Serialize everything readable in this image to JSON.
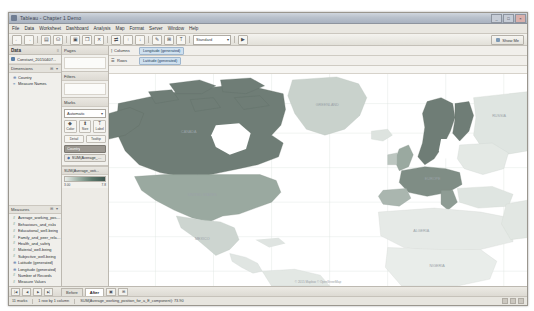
{
  "window": {
    "title": "Tableau - Chapter 1 Demo",
    "app_icon": "tableau-icon",
    "minimize": "_",
    "maximize": "□",
    "close": "×"
  },
  "menu": {
    "items": [
      "File",
      "Data",
      "Worksheet",
      "Dashboard",
      "Analysis",
      "Map",
      "Format",
      "Server",
      "Window",
      "Help"
    ]
  },
  "toolbar": {
    "buttons": [
      {
        "name": "back-button",
        "glyph": "←"
      },
      {
        "name": "forward-button",
        "glyph": "→"
      },
      {
        "name": "save-button",
        "glyph": "▤"
      },
      {
        "name": "new-data-source-button",
        "glyph": "⛁"
      },
      {
        "name": "new-worksheet-button",
        "glyph": "▣"
      },
      {
        "name": "duplicate-sheet-button",
        "glyph": "❐"
      },
      {
        "name": "clear-sheet-button",
        "glyph": "✕"
      },
      {
        "name": "swap-rows-columns-button",
        "glyph": "⇄"
      },
      {
        "name": "sort-ascending-button",
        "glyph": "↑"
      },
      {
        "name": "sort-descending-button",
        "glyph": "↓"
      },
      {
        "name": "highlight-button",
        "glyph": "✎"
      },
      {
        "name": "group-members-button",
        "glyph": "⊞"
      },
      {
        "name": "show-mark-labels-button",
        "glyph": "T"
      },
      {
        "name": "presentation-mode-button",
        "glyph": "▶"
      }
    ],
    "fit_label": "Standard",
    "fit_caret": "▾",
    "showme_label": "Show Me"
  },
  "data_pane": {
    "header": "Data",
    "header_control": "≡",
    "datasource": "Constant_20150407...",
    "datasource_icon": "database-icon",
    "dimensions_label": "Dimensions",
    "dimensions_control": "⊞ ▾",
    "dimensions": [
      {
        "label": "Country",
        "icon": "globe-icon"
      },
      {
        "label": "Measure Names",
        "icon": "abc-icon"
      }
    ],
    "measures_label": "Measures",
    "measures_control": "⊞ ▾",
    "measures": [
      {
        "label": "Average_working_position",
        "icon": "hash-icon"
      },
      {
        "label": "Behaviours_and_risks",
        "icon": "hash-icon"
      },
      {
        "label": "Educational_well-being",
        "icon": "hash-icon"
      },
      {
        "label": "Family_and_peer_relation",
        "icon": "hash-icon"
      },
      {
        "label": "Health_and_safety",
        "icon": "hash-icon"
      },
      {
        "label": "Material_well-being",
        "icon": "hash-icon"
      },
      {
        "label": "Subjective_well-being",
        "icon": "hash-icon"
      },
      {
        "label": "Latitude (generated)",
        "icon": "globe-icon"
      },
      {
        "label": "Longitude (generated)",
        "icon": "globe-icon"
      },
      {
        "label": "Number of Records",
        "icon": "hash-icon"
      },
      {
        "label": "Measure Values",
        "icon": "hash-icon"
      }
    ]
  },
  "cards": {
    "pages_label": "Pages",
    "filters_label": "Filters",
    "marks_label": "Marks",
    "marks_type": "Automatic",
    "marks_type_caret": "▾",
    "mark_buttons": [
      {
        "label": "Color",
        "icon": "color-palette-icon",
        "glyph": "◆"
      },
      {
        "label": "Size",
        "icon": "size-icon",
        "glyph": "⬍"
      },
      {
        "label": "Label",
        "icon": "label-icon",
        "glyph": "T"
      }
    ],
    "mark_buttons_secondary": [
      {
        "label": "Detail",
        "icon": "detail-icon"
      },
      {
        "label": "Tooltip",
        "icon": "tooltip-icon"
      }
    ],
    "mark_pills": [
      {
        "label": "Country",
        "icon": "detail-icon",
        "selected": true
      },
      {
        "label": "SUM(Average_w...)",
        "icon": "color-icon",
        "selected": false
      }
    ],
    "legend_title": "SUM(Average_voti...",
    "legend_min": "3.00",
    "legend_max": "7.8"
  },
  "shelves": {
    "columns_label": "Columns",
    "columns_icon": "columns-icon",
    "columns_pill": "Longitude (generated)",
    "rows_label": "Rows",
    "rows_icon": "rows-icon",
    "rows_pill": "Latitude (generated)"
  },
  "map": {
    "attribution": "© 2015 Mapbox © OpenStreetMap",
    "labels": [
      {
        "text": "GREENLAND",
        "x": 372,
        "y": 95
      },
      {
        "text": "CANADA",
        "x": 262,
        "y": 140
      },
      {
        "text": "UNITED STATES",
        "x": 246,
        "y": 200
      },
      {
        "text": "MEXICO",
        "x": 250,
        "y": 243
      },
      {
        "text": "RUSSIA",
        "x": 497,
        "y": 105
      },
      {
        "text": "EUROPE",
        "x": 455,
        "y": 150
      },
      {
        "text": "ALGERIA",
        "x": 440,
        "y": 222
      },
      {
        "text": "NIGERIA",
        "x": 455,
        "y": 252
      }
    ],
    "colors": {
      "dark": "#6f7d76",
      "mid": "#9aa9a0",
      "light": "#c6cfc9",
      "pale": "#e3e8e4",
      "ocean": "#ffffff",
      "border": "#cdd3cf"
    }
  },
  "sheet_tabs": {
    "nav_first": "|◀",
    "nav_prev": "◀",
    "nav_next": "▶",
    "nav_last": "▶|",
    "tabs": [
      {
        "label": "Before",
        "active": false
      },
      {
        "label": "After",
        "active": true
      }
    ],
    "new_sheet": "▣",
    "new_dashboard": "⊞"
  },
  "status": {
    "marks": "11 marks",
    "rows_cols": "1 row by 1 column",
    "aggregate": "SUM(Average_working_position_for_a_E_component): 73.90",
    "right_icons": [
      "grid-icon",
      "data-icon",
      "fit-icon"
    ]
  }
}
